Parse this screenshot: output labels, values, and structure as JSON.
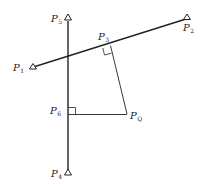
{
  "diagram": {
    "type": "geometry-perpendicular-projection",
    "colors": {
      "line": "#222222",
      "background": "#ffffff"
    },
    "points": [
      {
        "id": "P1",
        "label": "P",
        "sub": "1",
        "x": 33,
        "y": 67,
        "marker": "triangle"
      },
      {
        "id": "P2",
        "label": "P",
        "sub": "2",
        "x": 188,
        "y": 18,
        "marker": "triangle"
      },
      {
        "id": "P3",
        "label": "P",
        "sub": "3",
        "x": 110,
        "y": 44,
        "marker": "none"
      },
      {
        "id": "P4",
        "label": "P",
        "sub": "4",
        "x": 68,
        "y": 173,
        "marker": "triangle"
      },
      {
        "id": "P5",
        "label": "P",
        "sub": "5",
        "x": 68,
        "y": 17,
        "marker": "triangle"
      },
      {
        "id": "P6",
        "label": "P",
        "sub": "6",
        "x": 68,
        "y": 115,
        "marker": "none"
      },
      {
        "id": "PQ",
        "label": "P",
        "sub": "Q",
        "x": 128,
        "y": 115,
        "marker": "none"
      }
    ],
    "segments": [
      {
        "from": "P1",
        "to": "P2",
        "style": "thick"
      },
      {
        "from": "P5",
        "to": "P4",
        "style": "thick"
      },
      {
        "from": "P3",
        "to": "PQ",
        "style": "thin"
      },
      {
        "from": "P6",
        "to": "PQ",
        "style": "thin"
      }
    ],
    "right_angles": [
      "P3",
      "P6"
    ],
    "labels": {
      "p1": "P",
      "p1_sub": "1",
      "p2": "P",
      "p2_sub": "2",
      "p3": "P",
      "p3_sub": "3",
      "p4": "P",
      "p4_sub": "4",
      "p5": "P",
      "p5_sub": "5",
      "p6": "P",
      "p6_sub": "6",
      "pq": "P",
      "pq_sub": "Q"
    }
  }
}
